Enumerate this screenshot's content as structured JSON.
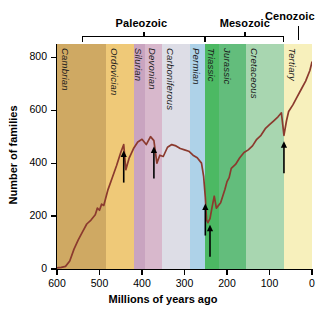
{
  "chart_data": {
    "type": "line",
    "title": "",
    "xlabel": "Millions of years ago",
    "ylabel": "Number of families",
    "xlim": [
      600,
      0
    ],
    "ylim": [
      0,
      850
    ],
    "xticks": [
      600,
      500,
      400,
      300,
      200,
      100,
      0
    ],
    "yticks": [
      0,
      200,
      400,
      600,
      800
    ],
    "grid": false,
    "legend": "none",
    "reversed_x": true,
    "line_color": "#8B3A2E",
    "series": [
      {
        "name": "Number of families",
        "x": [
          600,
          590,
          580,
          570,
          560,
          550,
          540,
          530,
          520,
          510,
          505,
          500,
          495,
          490,
          485,
          480,
          470,
          460,
          450,
          443,
          438,
          430,
          420,
          410,
          400,
          390,
          380,
          372,
          365,
          358,
          350,
          340,
          330,
          320,
          310,
          300,
          290,
          280,
          270,
          260,
          255,
          251,
          248,
          245,
          240,
          235,
          230,
          225,
          215,
          205,
          200,
          195,
          190,
          180,
          170,
          160,
          150,
          140,
          130,
          120,
          110,
          100,
          90,
          80,
          72,
          66,
          60,
          55,
          45,
          35,
          25,
          15,
          5,
          0
        ],
        "y": [
          4,
          6,
          10,
          30,
          75,
          110,
          140,
          170,
          185,
          205,
          230,
          222,
          245,
          240,
          270,
          300,
          345,
          390,
          440,
          470,
          375,
          420,
          455,
          480,
          490,
          470,
          500,
          485,
          400,
          430,
          425,
          460,
          470,
          465,
          455,
          450,
          445,
          430,
          420,
          400,
          350,
          270,
          185,
          175,
          190,
          235,
          275,
          230,
          250,
          300,
          330,
          345,
          380,
          395,
          420,
          440,
          450,
          465,
          490,
          505,
          530,
          545,
          560,
          575,
          590,
          505,
          560,
          595,
          620,
          650,
          680,
          710,
          750,
          782
        ]
      }
    ],
    "annotations": [
      {
        "name": "end-ordovician-extinction",
        "x": 443,
        "label": ""
      },
      {
        "name": "late-devonian-extinction",
        "x": 372,
        "label": ""
      },
      {
        "name": "end-permian-extinction-a",
        "x": 251,
        "label": ""
      },
      {
        "name": "end-permian-extinction-b",
        "x": 240,
        "label": ""
      },
      {
        "name": "end-cretaceous-extinction",
        "x": 66,
        "label": ""
      }
    ]
  },
  "eras": [
    {
      "label": "Paleozoic",
      "x_start": 541,
      "x_end": 252
    },
    {
      "label": "Mesozoic",
      "x_start": 252,
      "x_end": 66
    },
    {
      "label": "Cenozoic",
      "x_start": 66,
      "x_end": 0
    }
  ],
  "periods": [
    {
      "label": "Cambrian",
      "x_start": 600,
      "x_end": 485,
      "color": "#cfa963"
    },
    {
      "label": "Ordovician",
      "x_start": 485,
      "x_end": 419,
      "color": "#efc978"
    },
    {
      "label": "Silurian",
      "x_start": 419,
      "x_end": 393,
      "color": "#c9a4c0"
    },
    {
      "label": "Devonian",
      "x_start": 393,
      "x_end": 354,
      "color": "#d8b8cc"
    },
    {
      "label": "Carboniferous",
      "x_start": 354,
      "x_end": 287,
      "color": "#dddde6"
    },
    {
      "label": "Permian",
      "x_start": 287,
      "x_end": 252,
      "color": "#aed2e8"
    },
    {
      "label": "Triassic",
      "x_start": 252,
      "x_end": 218,
      "color": "#4cb963"
    },
    {
      "label": "Jurassic",
      "x_start": 218,
      "x_end": 156,
      "color": "#63bd7c"
    },
    {
      "label": "Cretaceous",
      "x_start": 156,
      "x_end": 66,
      "color": "#a8d6b0"
    },
    {
      "label": "Tertiary",
      "x_start": 66,
      "x_end": 0,
      "color": "#f7f0bc"
    }
  ]
}
